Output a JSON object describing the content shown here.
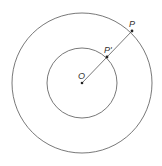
{
  "diagram": {
    "type": "concentric-circles",
    "center": {
      "label": "O",
      "x": 82,
      "y": 83
    },
    "outer_circle": {
      "r": 70,
      "point": {
        "label": "P",
        "x": 132,
        "y": 31
      }
    },
    "inner_circle": {
      "r": 35,
      "point": {
        "label": "P'",
        "x": 107,
        "y": 57
      }
    },
    "segment": {
      "from": "O",
      "to": "P"
    },
    "stroke_color": "#555555",
    "point_color": "#222222"
  }
}
